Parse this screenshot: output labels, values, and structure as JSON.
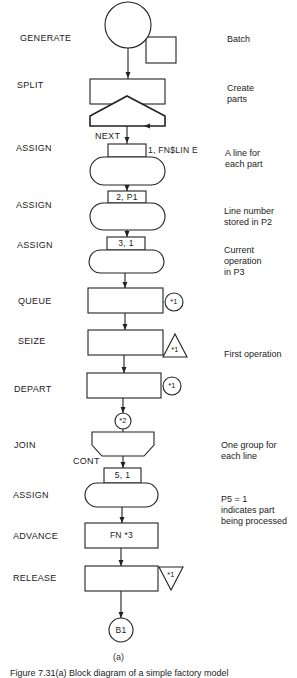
{
  "blocks": [
    {
      "name": "GENERATE",
      "note": "Batch"
    },
    {
      "name": "SPLIT",
      "note": "Create\nparts"
    },
    {
      "name": "ASSIGN",
      "operand": "1, FN$LIN E",
      "label": "NEXT",
      "note": "A line for\neach part"
    },
    {
      "name": "ASSIGN",
      "operand": "2, P1",
      "note": "Line number\nstored in P2"
    },
    {
      "name": "ASSIGN",
      "operand": "3, 1",
      "note": "Current\noperation\nin P3"
    },
    {
      "name": "QUEUE",
      "marker": "*1"
    },
    {
      "name": "SEIZE",
      "marker": "*1",
      "note": "First operation"
    },
    {
      "name": "DEPART",
      "marker": "*1"
    },
    {
      "name": "JOIN",
      "entry_marker": "*2",
      "note": "One group for\neach line"
    },
    {
      "name": "ASSIGN",
      "operand": "5, 1",
      "label": "CONT",
      "note": "P5 = 1\nindicates part\nbeing processed"
    },
    {
      "name": "ADVANCE",
      "operand": "FN *3"
    },
    {
      "name": "RELEASE",
      "marker": "*1"
    },
    {
      "name": "TRANSFER_TARGET",
      "marker": "B1"
    }
  ],
  "caption": {
    "part": "(a)",
    "text": "Figure 7.31(a)  Block diagram of a simple factory model"
  }
}
